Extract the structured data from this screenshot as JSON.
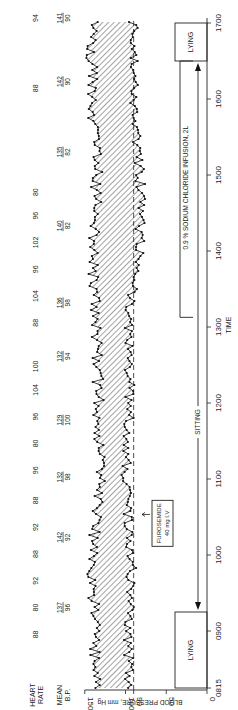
{
  "chart_data": {
    "type": "area",
    "orientation": "rotated-90-ccw",
    "title": "",
    "xlabel": "TIME",
    "ylabel": "BLOOD PRESSURE, mm Hg",
    "ylim": [
      0,
      150
    ],
    "y_ticks": [
      0,
      50,
      90,
      100,
      150
    ],
    "x_ticks": [
      "0815",
      "0900",
      "1000",
      "1100",
      "1200",
      "1300",
      "1400",
      "1500",
      "1600",
      "1700"
    ],
    "x_range": [
      "0815",
      "1700"
    ],
    "reference_line": {
      "value": 90,
      "style": "dashed"
    },
    "series": [
      {
        "name": "Systolic",
        "approx_level": 140,
        "x": [
          "0815",
          "0900",
          "1000",
          "1030",
          "1100",
          "1200",
          "1300",
          "1400",
          "1500",
          "1600",
          "1700"
        ],
        "values": [
          137,
          137,
          142,
          136,
          132,
          133,
          136,
          140,
          135,
          142,
          141
        ]
      },
      {
        "name": "Diastolic",
        "approx_level": 92,
        "x": [
          "0815",
          "0900",
          "1000",
          "1030",
          "1100",
          "1200",
          "1300",
          "1400",
          "1500",
          "1600",
          "1700"
        ],
        "values": [
          96,
          96,
          92,
          98,
          100,
          94,
          98,
          82,
          82,
          90,
          90
        ]
      }
    ],
    "shading": "hatched region between systolic and diastolic",
    "heart_rate_label": "HEART RATE",
    "heart_rate": [
      {
        "time_pos": 0.08,
        "value": 88
      },
      {
        "time_pos": 0.12,
        "value": 80
      },
      {
        "time_pos": 0.16,
        "value": 92
      },
      {
        "time_pos": 0.2,
        "value": 88
      },
      {
        "time_pos": 0.24,
        "value": 92
      },
      {
        "time_pos": 0.28,
        "value": 88
      },
      {
        "time_pos": 0.325,
        "value": 96
      },
      {
        "time_pos": 0.365,
        "value": 80
      },
      {
        "time_pos": 0.405,
        "value": 96
      },
      {
        "time_pos": 0.445,
        "value": 104
      },
      {
        "time_pos": 0.48,
        "value": 100
      },
      {
        "time_pos": 0.545,
        "value": 88
      },
      {
        "time_pos": 0.585,
        "value": 104
      },
      {
        "time_pos": 0.625,
        "value": 96
      },
      {
        "time_pos": 0.665,
        "value": 102
      },
      {
        "time_pos": 0.705,
        "value": 96
      },
      {
        "time_pos": 0.74,
        "value": 80
      },
      {
        "time_pos": 0.895,
        "value": 88
      },
      {
        "time_pos": 1.0,
        "value": 94
      }
    ],
    "mean_bp_label": [
      "MEAN",
      "B.P."
    ],
    "mean_bp": [
      {
        "time_pos": 0.12,
        "sys": "137",
        "dia": "96"
      },
      {
        "time_pos": 0.225,
        "sys": "142",
        "dia": "92"
      },
      {
        "time_pos": 0.315,
        "sys": "132",
        "dia": "98"
      },
      {
        "time_pos": 0.4,
        "sys": "129",
        "dia": "100"
      },
      {
        "time_pos": 0.495,
        "sys": "132",
        "dia": "94"
      },
      {
        "time_pos": 0.575,
        "sys": "136",
        "dia": "98"
      },
      {
        "time_pos": 0.69,
        "sys": "140",
        "dia": "82"
      },
      {
        "time_pos": 0.8,
        "sys": "135",
        "dia": "82"
      },
      {
        "time_pos": 0.905,
        "sys": "142",
        "dia": "90"
      },
      {
        "time_pos": 1.0,
        "sys": "141",
        "dia": "90"
      }
    ],
    "annotations": [
      {
        "text": [
          "FUROSEMIDE",
          "40 mg I.V"
        ],
        "time": "~1030",
        "pointer": "arrow to diastolic trace"
      },
      {
        "text": "0.9 % SODIUM CHLORIDE INFUSION, 2L",
        "time_range": [
          "1310",
          "1630"
        ]
      },
      {
        "text": "LYING",
        "time_range": [
          "0815",
          "0915"
        ]
      },
      {
        "text": "SITTING",
        "time_range": [
          "0915",
          "1630"
        ],
        "style": "double-headed arrow"
      },
      {
        "text": "LYING",
        "time_range": [
          "1630",
          "1700"
        ]
      }
    ]
  },
  "labels": {
    "heart_rate_1": "HEART",
    "heart_rate_2": "RATE",
    "mean_1": "MEAN",
    "mean_2": "B.P.",
    "y_axis": "BLOOD PRESSURE, mm Hg",
    "x_axis": "TIME",
    "furosemide_1": "FUROSEMIDE",
    "furosemide_2": "40 mg I.V",
    "infusion": "0.9 %  SODIUM  CHLORIDE  INFUSION, 2L",
    "lying_start": "LYING",
    "sitting": "SITTING",
    "lying_end": "LYING"
  }
}
